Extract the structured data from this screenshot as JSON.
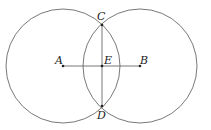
{
  "diagram": {
    "stroke_color": "#555555",
    "points": {
      "A": {
        "label": "A",
        "x": 63,
        "y": 66
      },
      "B": {
        "label": "B",
        "x": 140,
        "y": 66
      },
      "C": {
        "label": "C",
        "x": 102,
        "y": 25
      },
      "D": {
        "label": "D",
        "x": 102,
        "y": 106
      },
      "E": {
        "label": "E",
        "x": 102,
        "y": 66
      }
    },
    "circles": [
      {
        "center": "A",
        "radius": 57
      },
      {
        "center": "B",
        "radius": 57
      }
    ],
    "segments": [
      [
        "A",
        "B"
      ],
      [
        "C",
        "D"
      ]
    ]
  }
}
